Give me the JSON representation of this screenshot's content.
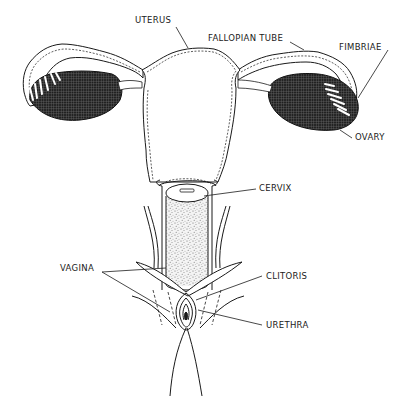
{
  "diagram": {
    "type": "anatomical-illustration",
    "style": "black and white line drawing",
    "labels": {
      "uterus": "UTERUS",
      "fallopian_tube": "FALLOPIAN TUBE",
      "fimbriae": "FIMBRIAE",
      "ovary": "OVARY",
      "cervix": "CERVIX",
      "vagina": "VAGINA",
      "clitoris": "CLITORIS",
      "urethra": "URETHRA"
    },
    "colors": {
      "ink": "#1a1a1a",
      "ovary_fill": "#222222",
      "background": "#ffffff"
    }
  }
}
